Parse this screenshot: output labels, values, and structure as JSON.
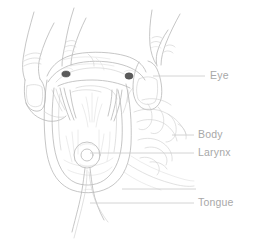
{
  "figure": {
    "style": "line-art-illustration",
    "background_color": "#ffffff",
    "line_color": "#b3b3b3",
    "label_color": "#a8a8a8",
    "leader_color": "#c9c9c9",
    "eye_color": "#5b5b5b"
  },
  "labels": [
    {
      "id": "eye",
      "text": "Eye",
      "x": 210,
      "y": 76,
      "leader_x1": 153,
      "leader_x2": 205,
      "leader_y": 76
    },
    {
      "id": "body",
      "text": "Body",
      "x": 198,
      "y": 135,
      "leader_x1": 172,
      "leader_x2": 194,
      "leader_y": 135
    },
    {
      "id": "larynx",
      "text": "Larynx",
      "x": 198,
      "y": 153,
      "leader_x1": 90,
      "leader_x2": 194,
      "leader_y": 153
    },
    {
      "id": "tongue",
      "text": "Tongue",
      "x": 198,
      "y": 203,
      "leader_x1": 90,
      "leader_x2": 194,
      "leader_y": 203
    }
  ],
  "unlabeled_leaders": [
    {
      "id": "lower-jaw-leader",
      "x1": 122,
      "x2": 196,
      "y": 189
    }
  ],
  "parts": {
    "eye_left": {
      "cx": 66,
      "cy": 74,
      "rx": 4.2,
      "ry": 3.0
    },
    "eye_right": {
      "cx": 129,
      "cy": 76,
      "rx": 4.0,
      "ry": 3.2
    },
    "larynx": {
      "cx": 87,
      "cy": 155,
      "r_outer": 13,
      "r_inner": 6
    }
  }
}
